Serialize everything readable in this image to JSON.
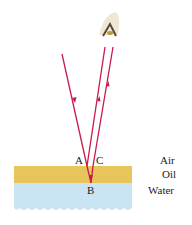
{
  "diagram": {
    "media": [
      {
        "name": "Air",
        "color": "#ffffff"
      },
      {
        "name": "Oil",
        "color": "#e8c55a"
      },
      {
        "name": "Water",
        "color": "#c9e4f2"
      }
    ],
    "points": [
      {
        "label": "A"
      },
      {
        "label": "C"
      },
      {
        "label": "B"
      }
    ],
    "ray_color": "#c8194a",
    "observer": "eye-icon"
  }
}
